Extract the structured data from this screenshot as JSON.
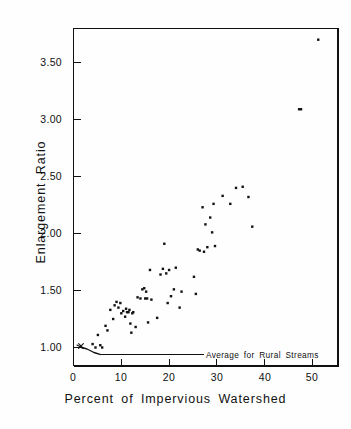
{
  "figure": {
    "background_color": "#fefefe",
    "ink_color": "#111111"
  },
  "chart_data": {
    "type": "scatter",
    "title": "",
    "xlabel": "Percent of  Impervious Watershed",
    "ylabel": "Enlargement   Ratio",
    "xlim": [
      0,
      55.5
    ],
    "ylim": [
      0.72,
      3.82
    ],
    "grid": false,
    "legend": "none",
    "xticks": [
      0,
      10,
      20,
      30,
      40,
      50
    ],
    "xtick_labels": [
      "0",
      "10",
      "20",
      "30",
      "40",
      "50"
    ],
    "yticks": [
      1.0,
      1.5,
      2.0,
      2.5,
      3.0,
      3.5
    ],
    "ytick_labels": [
      "1.00",
      "1.50",
      "2.00",
      "2.50",
      "3.00",
      "3.50"
    ],
    "marker": "filled-square-dot",
    "marker_color": "#111111",
    "marker_size_px": 2.4,
    "x": [
      4.0,
      4.6,
      5.1,
      5.6,
      6.0,
      6.7,
      7.1,
      7.7,
      8.3,
      8.6,
      9.0,
      9.4,
      9.8,
      10.0,
      10.4,
      10.8,
      11.0,
      11.2,
      11.5,
      11.7,
      11.9,
      12.1,
      12.3,
      12.5,
      13.0,
      13.4,
      14.0,
      14.4,
      14.8,
      15.0,
      15.2,
      15.4,
      15.6,
      16.0,
      16.3,
      17.5,
      18.2,
      18.7,
      19.0,
      19.4,
      19.7,
      20.0,
      20.4,
      21.0,
      21.4,
      22.2,
      22.6,
      25.2,
      25.6,
      26.0,
      26.4,
      27.0,
      27.3,
      27.6,
      28.0,
      28.6,
      29.0,
      29.3,
      29.6,
      31.2,
      32.8,
      34.0,
      35.4,
      36.6,
      37.4,
      47.2,
      47.6,
      51.2
    ],
    "y": [
      1.03,
      1.0,
      1.11,
      1.02,
      1.0,
      1.19,
      1.15,
      1.33,
      1.25,
      1.37,
      1.4,
      1.35,
      1.39,
      1.3,
      1.32,
      1.27,
      1.34,
      1.31,
      1.31,
      1.33,
      1.21,
      1.13,
      1.3,
      1.31,
      1.18,
      1.44,
      1.43,
      1.51,
      1.52,
      1.43,
      1.49,
      1.43,
      1.22,
      1.68,
      1.42,
      1.26,
      1.64,
      1.69,
      1.91,
      1.65,
      1.39,
      1.68,
      1.45,
      1.51,
      1.7,
      1.35,
      1.49,
      1.62,
      1.47,
      1.86,
      1.85,
      2.23,
      1.84,
      2.08,
      1.88,
      2.14,
      2.01,
      2.26,
      1.89,
      2.33,
      2.26,
      2.4,
      2.41,
      2.32,
      2.06,
      3.09,
      3.09,
      3.7
    ],
    "annotations": [
      {
        "id": "rural-average",
        "text": "Average for  Rural  Streams",
        "line_y_value": 0.94,
        "line_x_start": 5.6,
        "line_x_end": 27.6,
        "text_x_px": 206,
        "text_y_px": 355,
        "marker": "x",
        "marker_x_value": 1.9,
        "marker_y_value": 1.0,
        "description": "x-marker at ratio 1.00 near origin joined by an arrow curve down to the horizontal rural-average reference line at 0.94"
      }
    ]
  },
  "axes_frame": {
    "left_px": 73,
    "right_px": 338,
    "top_px": 28,
    "bottom_px": 366
  }
}
